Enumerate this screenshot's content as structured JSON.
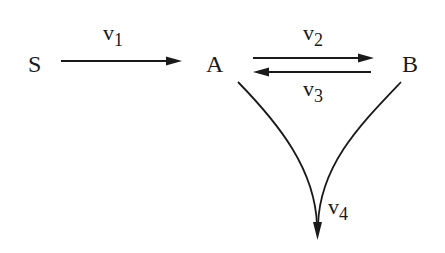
{
  "diagram": {
    "type": "reaction-network",
    "nodes": [
      {
        "id": "S",
        "label": "S"
      },
      {
        "id": "A",
        "label": "A"
      },
      {
        "id": "B",
        "label": "B"
      }
    ],
    "edges": [
      {
        "id": "v1",
        "from": "S",
        "to": "A",
        "label": "v",
        "subscript": "1"
      },
      {
        "id": "v2",
        "from": "A",
        "to": "B",
        "label": "v",
        "subscript": "2"
      },
      {
        "id": "v3",
        "from": "B",
        "to": "A",
        "label": "v",
        "subscript": "3"
      },
      {
        "id": "v4",
        "from": [
          "A",
          "B"
        ],
        "to": "sink",
        "label": "v",
        "subscript": "4"
      }
    ]
  }
}
